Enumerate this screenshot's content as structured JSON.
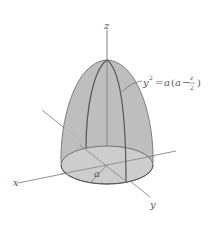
{
  "figure": {
    "axes": {
      "x_label": "x",
      "y_label": "y",
      "z_label": "z"
    },
    "radius_label": "a",
    "equation": {
      "lhs": "y",
      "exp": "2",
      "eq": "=",
      "rhs_a": "a",
      "open": "(",
      "inner_a": "a",
      "minus": "−",
      "frac_num": "z",
      "frac_den": "2",
      "close": ")"
    },
    "colors": {
      "surface": "#b8b8b8",
      "base": "#cfcfcf",
      "line": "#555555",
      "axis": "#666666"
    }
  }
}
